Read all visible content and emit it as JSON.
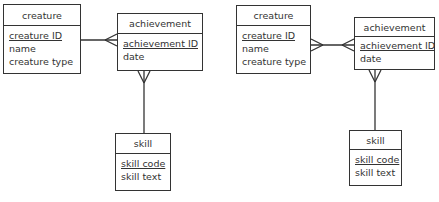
{
  "diagrams": [
    {
      "creature": {
        "title": "creature",
        "attributes": [
          {
            "name": "creature ID",
            "key": true
          },
          {
            "name": "name",
            "key": false
          },
          {
            "name": "creature type",
            "key": false
          }
        ]
      },
      "achievement": {
        "title": "achievement",
        "attributes": [
          {
            "name": "achievement ID",
            "key": true
          },
          {
            "name": "date",
            "key": false
          }
        ]
      },
      "skill": {
        "title": "skill",
        "attributes": [
          {
            "name": "skill code",
            "key": true
          },
          {
            "name": "skill text",
            "key": false
          }
        ]
      },
      "relationships": [
        {
          "from": "creature",
          "to": "achievement",
          "from_end": "one",
          "to_end": "many"
        },
        {
          "from": "achievement",
          "to": "skill",
          "from_end": "many",
          "to_end": "one"
        }
      ]
    },
    {
      "creature": {
        "title": "creature",
        "attributes": [
          {
            "name": "creature ID",
            "key": true
          },
          {
            "name": "name",
            "key": false
          },
          {
            "name": "creature type",
            "key": false
          }
        ]
      },
      "achievement": {
        "title": "achievement",
        "attributes": [
          {
            "name": "achievement ID",
            "key": true
          },
          {
            "name": "date",
            "key": false
          }
        ]
      },
      "skill": {
        "title": "skill",
        "attributes": [
          {
            "name": "skill code",
            "key": true
          },
          {
            "name": "skill text",
            "key": false
          }
        ]
      },
      "relationships": [
        {
          "from": "creature",
          "to": "achievement",
          "from_end": "many",
          "to_end": "many"
        },
        {
          "from": "achievement",
          "to": "skill",
          "from_end": "many",
          "to_end": "one"
        }
      ]
    }
  ],
  "colors": {
    "line": "#333333",
    "background": "#ffffff"
  }
}
